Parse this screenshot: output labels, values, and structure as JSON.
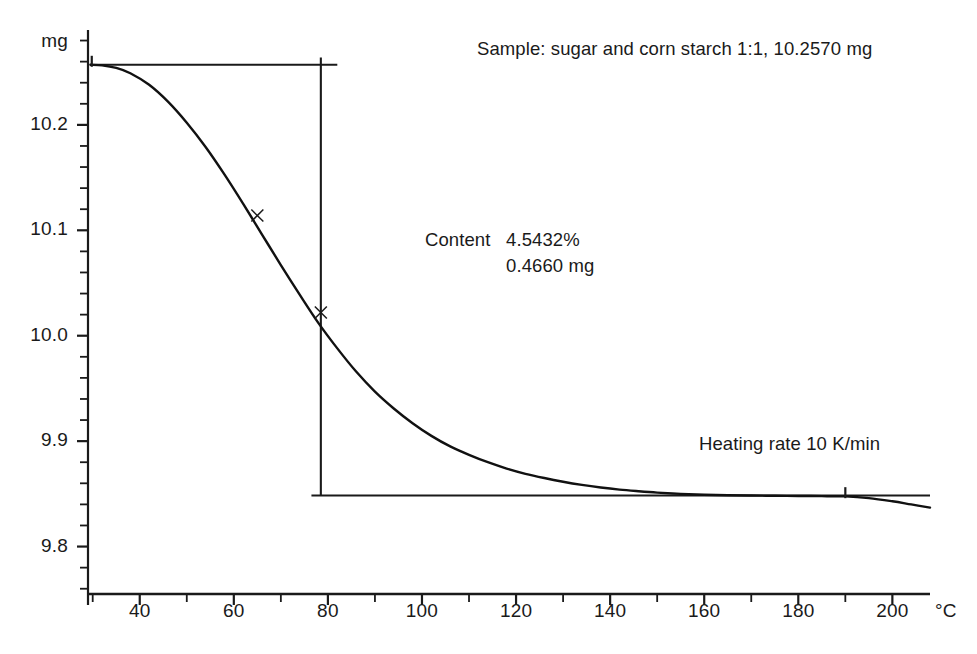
{
  "chart_data": {
    "type": "line",
    "title": "",
    "xlabel": "°C",
    "ylabel": "mg",
    "xlim": [
      29,
      208
    ],
    "ylim": [
      9.755,
      10.29
    ],
    "grid": false,
    "legend": "none",
    "x_ticks": [
      40,
      60,
      80,
      100,
      120,
      140,
      160,
      180,
      200
    ],
    "x_tick_labels": [
      "40",
      "60",
      "80",
      "100",
      "120",
      "140",
      "160",
      "180",
      "200"
    ],
    "x_minor_step": 10,
    "y_ticks": [
      10.2,
      10.1,
      10.0,
      9.9,
      9.8
    ],
    "y_tick_labels": [
      "10.2",
      "10.1",
      "10.0",
      "9.9",
      "9.8"
    ],
    "y_minor_step": 0.02,
    "series": [
      {
        "name": "TG mass loss curve",
        "x": [
          29.5,
          32,
          35,
          38,
          42,
          46,
          50,
          54,
          58,
          62,
          66,
          70,
          74,
          78,
          82,
          86,
          90,
          94,
          98,
          102,
          106,
          110,
          114,
          118,
          122,
          126,
          130,
          134,
          138,
          142,
          146,
          150,
          155,
          160,
          165,
          170,
          175,
          180,
          185,
          190,
          195,
          200,
          204,
          208
        ],
        "y": [
          10.257,
          10.2565,
          10.254,
          10.249,
          10.238,
          10.222,
          10.202,
          10.179,
          10.153,
          10.125,
          10.096,
          10.067,
          10.039,
          10.012,
          9.988,
          9.966,
          9.947,
          9.931,
          9.917,
          9.905,
          9.895,
          9.887,
          9.88,
          9.874,
          9.869,
          9.865,
          9.8615,
          9.8585,
          9.856,
          9.854,
          9.8525,
          9.8512,
          9.85,
          9.8492,
          9.8487,
          9.8484,
          9.8482,
          9.848,
          9.8478,
          9.8476,
          9.846,
          9.843,
          9.84,
          9.837
        ]
      }
    ],
    "construction_lines": {
      "upper_tangent": {
        "y": 10.257,
        "x_start": 29.5,
        "x_end": 82
      },
      "lower_tangent": {
        "y": 9.8485,
        "x_start": 76.5,
        "x_end": 208
      },
      "step_vertical": {
        "x": 78.5,
        "y_top": 10.264,
        "y_bottom": 9.8485
      }
    },
    "markers": [
      {
        "x": 29.8,
        "y": 10.257,
        "symbol": "tick"
      },
      {
        "x": 65.0,
        "y": 10.114,
        "symbol": "x"
      },
      {
        "x": 78.5,
        "y": 10.022,
        "symbol": "x"
      },
      {
        "x": 190.0,
        "y": 9.8478,
        "symbol": "tick"
      }
    ]
  },
  "annotations": {
    "sample": "Sample: sugar and corn starch 1:1, 10.2570 mg",
    "content_label": "Content",
    "content_percent": "4.5432%",
    "content_mass": "0.4660 mg",
    "heating_rate": "Heating rate 10 K/min"
  },
  "axes": {
    "y_unit": "mg",
    "x_unit": "°C"
  },
  "colors": {
    "ink": "#1a1a1a",
    "background": "#ffffff",
    "curve": "#111111"
  }
}
